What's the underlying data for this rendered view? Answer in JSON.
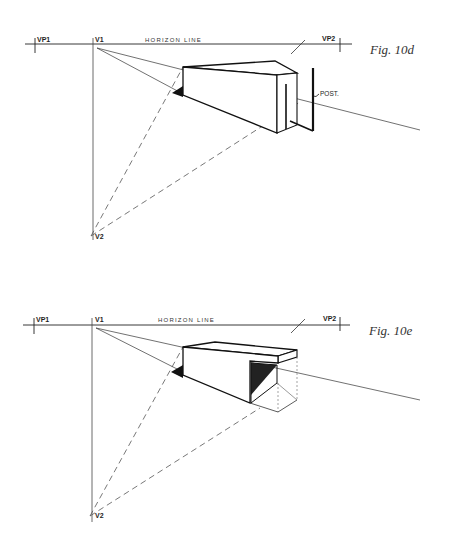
{
  "figures": [
    {
      "id": "fig-10d",
      "caption": "Fig. 10d",
      "horizon_label": "HORIZON LINE",
      "vp_left": "VP1",
      "v1": "V1",
      "vp_right": "VP2",
      "v2": "V2",
      "annotation": "POST."
    },
    {
      "id": "fig-10e",
      "caption": "Fig. 10e",
      "horizon_label": "HORIZON LINE",
      "vp_left": "VP1",
      "v1": "V1",
      "vp_right": "VP2",
      "v2": "V2"
    }
  ],
  "colors": {
    "ink": "#111111",
    "construction": "#555555",
    "background": "#ffffff"
  }
}
